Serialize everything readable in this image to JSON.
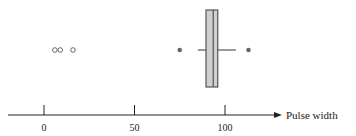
{
  "chart_data": {
    "type": "boxplot",
    "title": "",
    "xlabel": "Pulse width",
    "ylabel": "",
    "xlim": [
      -10,
      130
    ],
    "ticks": [
      0,
      50,
      100
    ],
    "tick_labels": [
      "0",
      "50",
      "100"
    ],
    "grid": false,
    "box": {
      "q1": 89.5,
      "median": 93.5,
      "q3": 96,
      "whisker_low": 85,
      "whisker_high": 106
    },
    "mild_outliers": [
      75,
      113
    ],
    "extreme_outliers": [
      6,
      9,
      16
    ],
    "colors": {
      "box_fill": "#cfcfcf",
      "line": "#555555",
      "outlier": "#666666"
    }
  }
}
